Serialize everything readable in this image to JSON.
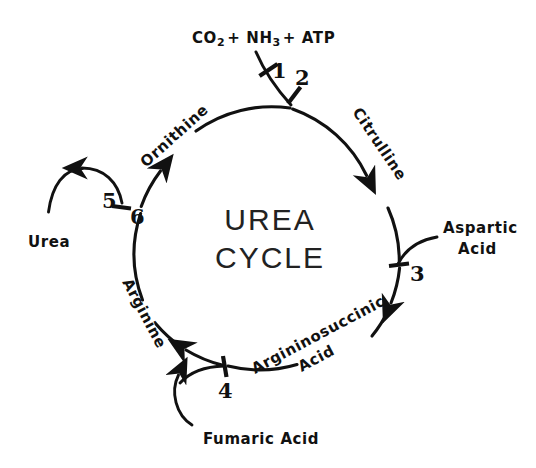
{
  "diagram": {
    "title_line1": "UREA",
    "title_line2": "CYCLE",
    "center_label": "UREA CYCLE",
    "type": "cyclic-pathway",
    "direction": "clockwise",
    "background_color": "#ffffff",
    "ink_color": "#111111"
  },
  "inputs": {
    "top": {
      "name": "co2-nh3-atp",
      "parts": {
        "co": "CO",
        "co_sub": "2",
        "plus1": "+ NH",
        "nh_sub": "3",
        "plus2": "+ ATP"
      },
      "full_text": "CO2 + NH3 + ATP",
      "enters_at_step": "1"
    },
    "right": {
      "name": "aspartic-acid",
      "line1": "Aspartic",
      "line2": "Acid",
      "full_text": "Aspartic Acid",
      "enters_at_step": "3"
    }
  },
  "outputs": {
    "left": {
      "name": "urea",
      "label": "Urea",
      "exits_at_step": "5"
    },
    "bottom": {
      "name": "fumaric-acid",
      "label": "Fumaric Acid",
      "exits_at_step": "4"
    }
  },
  "cycle_metabolites": [
    {
      "id": "citrulline",
      "label": "Citrulline",
      "position": "upper-right"
    },
    {
      "id": "argininosuccinic-acid",
      "label_line1": "Argininosuccinic",
      "label_line2": "Acid",
      "label": "Argininosuccinic Acid",
      "position": "lower-right"
    },
    {
      "id": "arginine",
      "label": "Arginine",
      "position": "lower-left"
    },
    {
      "id": "ornithine",
      "label": "Ornithine",
      "position": "upper-left"
    }
  ],
  "steps": [
    {
      "number": "1",
      "position": "top-inlet"
    },
    {
      "number": "2",
      "position": "top-circle"
    },
    {
      "number": "3",
      "position": "right-circle"
    },
    {
      "number": "4",
      "position": "bottom-circle"
    },
    {
      "number": "5",
      "position": "left-branch"
    },
    {
      "number": "6",
      "position": "left-circle"
    }
  ]
}
